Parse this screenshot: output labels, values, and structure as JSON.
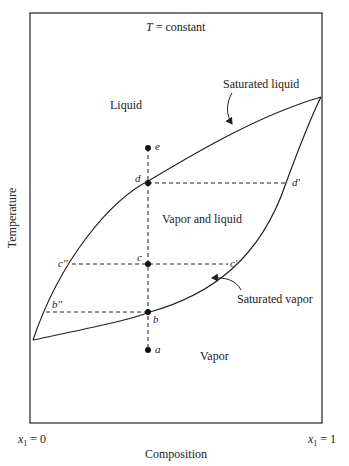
{
  "diagram": {
    "title": {
      "var": "T",
      "rest": " = constant"
    },
    "axes": {
      "ylabel": "Temperature",
      "xlabel": "Composition",
      "xmin_label": {
        "var": "x",
        "sub": "1",
        "rest": " = 0"
      },
      "xmax_label": {
        "var": "x",
        "sub": "1",
        "rest": " = 1"
      }
    },
    "regions": {
      "liquid": "Liquid",
      "two_phase": "Vapor and liquid",
      "vapor": "Vapor"
    },
    "curves": {
      "saturated_liquid": "Saturated liquid",
      "saturated_vapor": "Saturated vapor"
    },
    "points": {
      "e": "e",
      "d": "d",
      "c": "c",
      "b": "b",
      "a": "a",
      "d_prime": "d'",
      "c_prime": "c'",
      "c_dprime": "c''",
      "b_dprime": "b''"
    },
    "colors": {
      "line": "#222222",
      "background": "#ffffff"
    }
  }
}
